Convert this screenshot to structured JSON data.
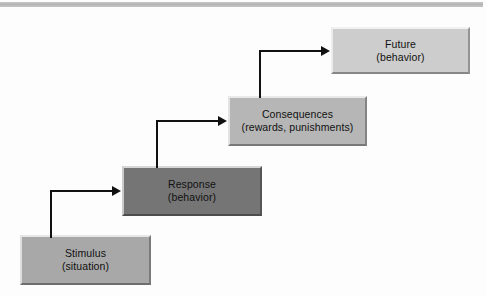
{
  "figure": {
    "type": "flow-diagram",
    "orientation": "ascending-staircase left-to-right",
    "background_color": "#fdfdfd",
    "header_bar_color": "#b4b4b4",
    "arrow_color": "#111111"
  },
  "nodes": [
    {
      "id": "stimulus",
      "line1": "Stimulus",
      "line2": "(situation)",
      "fill": "#a8a8a8",
      "step": 1
    },
    {
      "id": "response",
      "line1": "Response",
      "line2": "(behavior)",
      "fill": "#757575",
      "step": 2
    },
    {
      "id": "consequences",
      "line1": "Consequences",
      "line2": "(rewards, punishments)",
      "fill": "#b6b6b6",
      "step": 3
    },
    {
      "id": "future",
      "line1": "Future",
      "line2": "(behavior)",
      "fill": "#cdcdcd",
      "step": 4
    }
  ],
  "connectors": [
    {
      "id": "stimulus-to-response",
      "from": "stimulus",
      "to": "response",
      "shape": "elbow-up-right"
    },
    {
      "id": "response-to-consequences",
      "from": "response",
      "to": "consequences",
      "shape": "elbow-up-right"
    },
    {
      "id": "consequences-to-future",
      "from": "consequences",
      "to": "future",
      "shape": "elbow-up-right"
    }
  ]
}
